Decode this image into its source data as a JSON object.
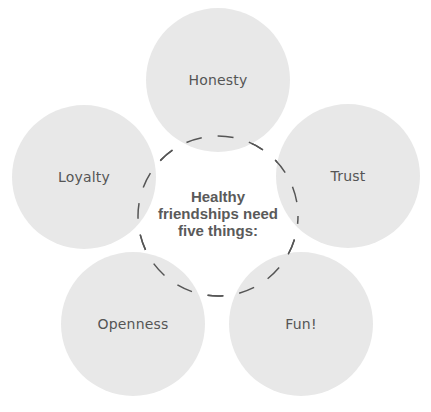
{
  "diagram": {
    "center": {
      "lines": [
        "Healthy",
        "friendships need",
        "five things:"
      ]
    },
    "items": [
      {
        "label": "Honesty"
      },
      {
        "label": "Trust"
      },
      {
        "label": "Fun!"
      },
      {
        "label": "Openness"
      },
      {
        "label": "Loyalty"
      }
    ],
    "colors": {
      "circle_fill": "#e8e8e8",
      "text": "#555555",
      "dash": "#555555"
    }
  }
}
